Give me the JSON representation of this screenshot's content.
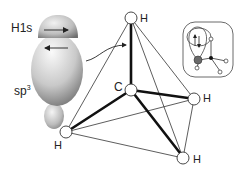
{
  "figure": {
    "orbital_labels": {
      "h1s": "H1s",
      "sp3_base": "sp",
      "sp3_sup": "3"
    },
    "atom_labels": {
      "carbon": "C",
      "h_top": "H",
      "h_right": "H",
      "h_bottom": "H",
      "h_left": "H"
    },
    "colors": {
      "bond_bold": "#111111",
      "bond_thin": "#333333",
      "orbital_light": "#f0f0f0",
      "orbital_dark": "#7a7a7a",
      "inset_sphere": "#6a6a6a"
    }
  }
}
